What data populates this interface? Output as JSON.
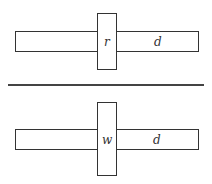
{
  "diagrams": [
    {
      "id": "top",
      "vertical_label": "r",
      "horizontal_label": "d"
    },
    {
      "id": "bottom",
      "vertical_label": "w",
      "horizontal_label": "d"
    }
  ],
  "colors": {
    "stroke": "#333333",
    "background": "#ffffff"
  }
}
